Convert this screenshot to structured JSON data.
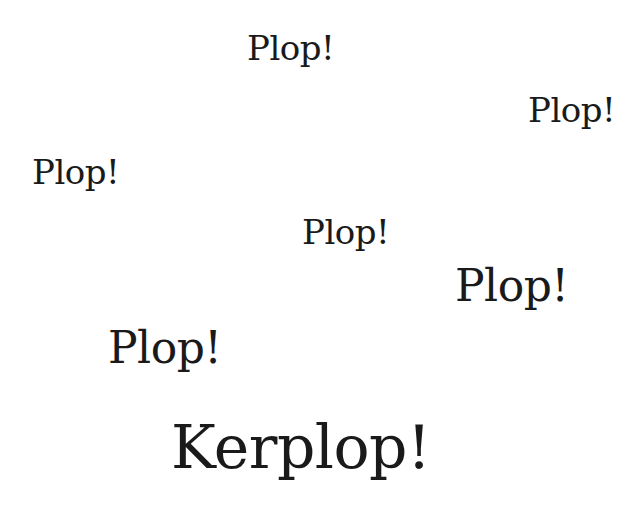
{
  "canvas": {
    "width": 644,
    "height": 528,
    "background": "#ffffff",
    "text_color": "#1a1a1a"
  },
  "words": [
    {
      "text": "Plop!",
      "x": 247,
      "y": 31,
      "size": 34
    },
    {
      "text": "Plop!",
      "x": 528,
      "y": 93,
      "size": 34
    },
    {
      "text": "Plop!",
      "x": 32,
      "y": 155,
      "size": 34
    },
    {
      "text": "Plop!",
      "x": 302,
      "y": 215,
      "size": 34
    },
    {
      "text": "Plop!",
      "x": 455,
      "y": 264,
      "size": 44
    },
    {
      "text": "Plop!",
      "x": 108,
      "y": 326,
      "size": 44
    },
    {
      "text": "Kerplop!",
      "x": 171,
      "y": 417,
      "size": 60
    }
  ]
}
